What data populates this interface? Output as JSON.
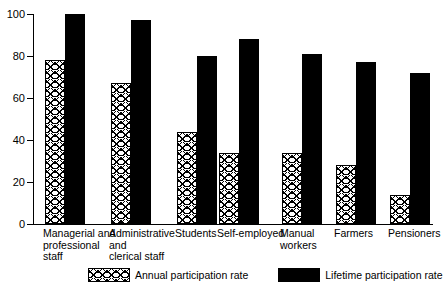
{
  "chart_data": {
    "type": "bar",
    "title": "",
    "subtitle": "",
    "xlabel": "",
    "ylabel": "",
    "ylim": [
      0,
      100
    ],
    "yticks": [
      0,
      20,
      40,
      60,
      80,
      100
    ],
    "grid": false,
    "legend_position": "bottom",
    "categories": [
      "Managerial and\nprofessional\nstaff",
      "Administrative\nand\nclerical staff",
      "Students",
      "Self-employed",
      "Manual\nworkers",
      "Farmers",
      "Pensioners"
    ],
    "series": [
      {
        "name": "Annual participation rate",
        "pattern": "crosshatch",
        "color": "#ffffff",
        "values": [
          78,
          67,
          44,
          34,
          34,
          28,
          14
        ]
      },
      {
        "name": "Lifetime participation rate",
        "pattern": "solid",
        "color": "#000000",
        "values": [
          100,
          97,
          80,
          88,
          81,
          77,
          72
        ]
      }
    ]
  },
  "legend": {
    "items": [
      {
        "label": "Annual participation rate",
        "swatch": "hatch-swatch"
      },
      {
        "label": "Lifetime participation rate",
        "swatch": "solid-swatch"
      }
    ]
  },
  "axis": {
    "y_tick_labels": [
      "100",
      "80",
      "60",
      "40",
      "20",
      "0"
    ]
  }
}
